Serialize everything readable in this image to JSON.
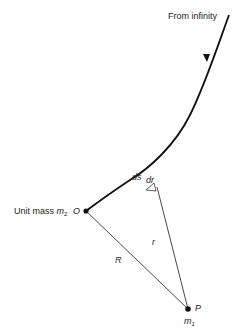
{
  "diagram": {
    "labels": {
      "from_infinity": "From infinity",
      "unit_mass_prefix": "Unit mass ",
      "m2": "m",
      "m2_sub": "2",
      "origin": "O",
      "ds": "ds",
      "dr": "dr",
      "r": "r",
      "R": "R",
      "point_P": "P",
      "m1": "m",
      "m1_sub": "1"
    },
    "colors": {
      "stroke": "#111111",
      "background": "#ffffff"
    }
  }
}
